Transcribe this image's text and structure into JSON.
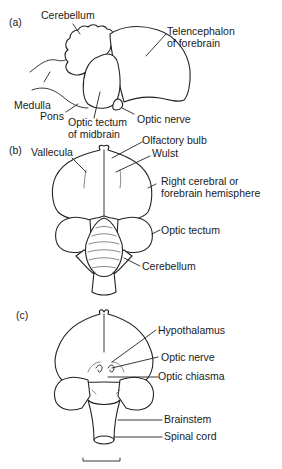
{
  "figure": {
    "panels": [
      {
        "id": "a",
        "tag": "(a)",
        "labels": {
          "cerebellum": "Cerebellum",
          "telencephalon_1": "Telencephalon",
          "telencephalon_2": "of forebrain",
          "medulla": "Medulla",
          "pons": "Pons",
          "optic_tectum_1": "Optic tectum",
          "optic_tectum_2": "of midbrain",
          "optic_nerve": "Optic nerve"
        }
      },
      {
        "id": "b",
        "tag": "(b)",
        "labels": {
          "vallecula": "Vallecula",
          "olfactory_bulb": "Olfactory bulb",
          "wulst": "Wulst",
          "hemisphere_1": "Right cerebral or",
          "hemisphere_2": "forebrain hemisphere",
          "optic_tectum": "Optic tectum",
          "cerebellum": "Cerebellum"
        }
      },
      {
        "id": "c",
        "tag": "(c)",
        "labels": {
          "hypothalamus": "Hypothalamus",
          "optic_nerve": "Optic nerve",
          "optic_chiasma": "Optic chiasma",
          "brainstem": "Brainstem",
          "spinal_cord": "Spinal cord"
        }
      }
    ]
  }
}
